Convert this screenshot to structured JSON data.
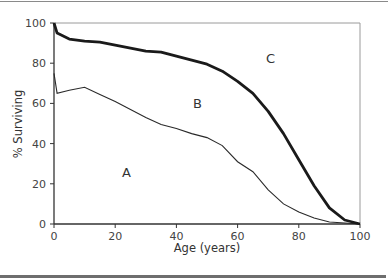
{
  "chart_data": {
    "type": "line",
    "title": "",
    "xlabel": "Age (years)",
    "ylabel": "% Surviving",
    "xlim": [
      0,
      100
    ],
    "ylim": [
      0,
      100
    ],
    "grid": false,
    "legend": null,
    "x_ticks": [
      "0",
      "20",
      "40",
      "60",
      "80",
      "100"
    ],
    "y_ticks": [
      "0",
      "20",
      "40",
      "60",
      "80",
      "100"
    ],
    "x": [
      0,
      1,
      5,
      10,
      15,
      20,
      25,
      30,
      35,
      40,
      45,
      50,
      55,
      60,
      65,
      70,
      75,
      80,
      85,
      90,
      95,
      100
    ],
    "series": [
      {
        "name": "upper curve (thick)",
        "style": "thick",
        "values": [
          100,
          95,
          92,
          91,
          90.5,
          89,
          87.5,
          86,
          85.5,
          83.5,
          81.5,
          79.5,
          76,
          71,
          65,
          56,
          45,
          32,
          19,
          8,
          2,
          0
        ]
      },
      {
        "name": "lower curve (thin)",
        "style": "thin",
        "values": [
          75,
          65,
          66.5,
          68,
          64.5,
          61,
          57,
          53,
          49.5,
          47.5,
          45,
          43,
          39,
          31,
          26,
          17,
          10,
          6,
          3,
          1,
          0.5,
          0
        ]
      }
    ],
    "annotations": [
      {
        "text": "A",
        "x": 24,
        "y": 26
      },
      {
        "text": "B",
        "x": 47,
        "y": 60
      },
      {
        "text": "C",
        "x": 71,
        "y": 82
      }
    ]
  },
  "labels": {
    "xlabel": "Age (years)",
    "ylabel": "% Surviving",
    "x_ticks": [
      "0",
      "20",
      "40",
      "60",
      "80",
      "100"
    ],
    "y_ticks": [
      "0",
      "20",
      "40",
      "60",
      "80",
      "100"
    ],
    "region_a": "A",
    "region_b": "B",
    "region_c": "C"
  }
}
